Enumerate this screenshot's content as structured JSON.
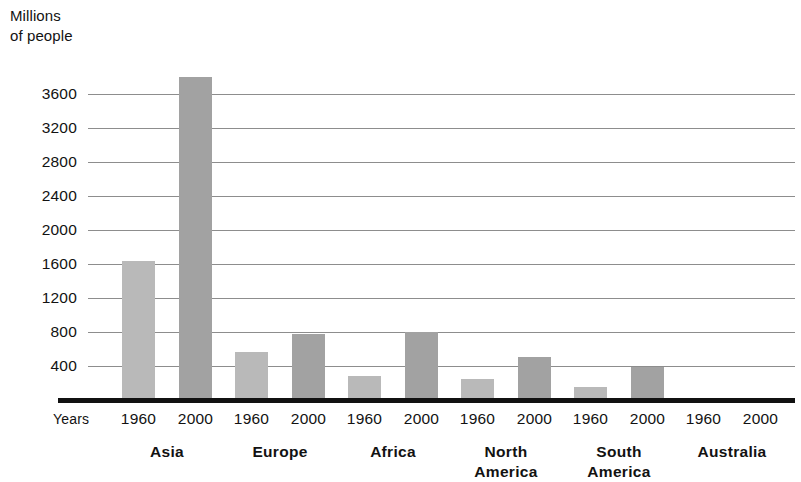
{
  "axis_title": "Millions\nof people",
  "years_row_label": "Years",
  "colors": {
    "bar_1960": "#b9b9b9",
    "bar_2000": "#a2a2a2",
    "gridline": "#8d8d8d",
    "axis": "#111111",
    "text": "#121212",
    "background": "#ffffff"
  },
  "chart_data": {
    "type": "bar",
    "title": "",
    "subtitle": "",
    "xlabel": "Years",
    "ylabel": "Millions of people",
    "ylim": [
      0,
      4000
    ],
    "ytick_labels": [
      "3600",
      "3200",
      "2800",
      "2400",
      "2000",
      "1600",
      "1200",
      "800",
      "400"
    ],
    "ytick_values": [
      3600,
      3200,
      2800,
      2400,
      2000,
      1600,
      1200,
      800,
      400
    ],
    "grid": true,
    "legend_position": "none",
    "categories": [
      "Asia",
      "Europe",
      "Africa",
      "North America",
      "South America",
      "Australia"
    ],
    "category_labels_wrapped": [
      [
        "Asia"
      ],
      [
        "Europe"
      ],
      [
        "Africa"
      ],
      [
        "North",
        "America"
      ],
      [
        "South",
        "America"
      ],
      [
        "Australia"
      ]
    ],
    "series": [
      {
        "name": "1960",
        "values": [
          1640,
          570,
          280,
          250,
          150,
          13
        ]
      },
      {
        "name": "2000",
        "values": [
          3800,
          775,
          800,
          510,
          390,
          19
        ]
      }
    ],
    "xtick_labels": [
      "1960",
      "2000",
      "1960",
      "2000",
      "1960",
      "2000",
      "1960",
      "2000",
      "1960",
      "2000",
      "1960",
      "2000"
    ]
  }
}
